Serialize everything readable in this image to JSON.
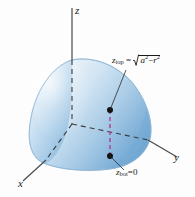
{
  "figure": {
    "type": "3d-math-diagram",
    "background_color": "#fdfdfd"
  },
  "axes": {
    "x_label": "x",
    "y_label": "y",
    "z_label": "z",
    "line_color": "#4a4a4a",
    "style_inside": "dashed",
    "style_outside": "solid"
  },
  "annotations": {
    "top": {
      "name": "z-top-label",
      "variable": "z",
      "subscript": "top",
      "equals": "=",
      "radicand_a": "a",
      "radicand_a_exp": "2",
      "minus": "−",
      "radicand_r": "r",
      "radicand_r_exp": "2",
      "full_text": "z_top = √(a² − r²)"
    },
    "bottom": {
      "name": "z-bot-label",
      "variable": "z",
      "subscript": "bot",
      "equals": "=",
      "value": "0",
      "full_text": "z_bot = 0"
    }
  },
  "surface": {
    "name": "hemisphere-octant-surface",
    "fill_light": "#f2f7fb",
    "fill_mid": "#bcd8ec",
    "fill_dark": "#6ba5d0",
    "edge_color": "#8fb8d6"
  },
  "markers": {
    "upper_point": {
      "name": "upper-point",
      "color": "#111111"
    },
    "lower_point": {
      "name": "lower-point",
      "color": "#111111"
    },
    "connector": {
      "name": "vertical-segment",
      "color": "#b04a9e",
      "style": "dashed"
    }
  },
  "leaders": {
    "top_leader_color": "#2b2b2b",
    "bottom_leader_color": "#2b2b2b"
  }
}
